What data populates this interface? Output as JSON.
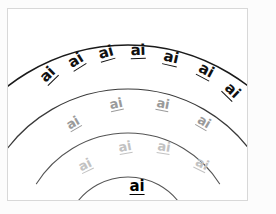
{
  "card": {
    "background": "#ffffff",
    "border_color": "#d8d8d8",
    "page_background": "#fcfcfc"
  },
  "worksheet": {
    "title": "ai rainbow words",
    "grapheme": "ai",
    "description": "Four concentric rainbow arcs with the word 'ai' repeated along each arc, fading from black to light gray."
  },
  "arcs": [
    {
      "name": "arc-1-outer",
      "stroke": "#1a1a1a",
      "stroke_width": 1.5,
      "cx": 120,
      "cy": 232,
      "r": 196,
      "start_angle": -152,
      "end_angle": -28
    },
    {
      "name": "arc-2",
      "stroke": "#3a3a3a",
      "stroke_width": 1.2,
      "cx": 120,
      "cy": 232,
      "r": 152,
      "start_angle": -150,
      "end_angle": -30
    },
    {
      "name": "arc-3",
      "stroke": "#555555",
      "stroke_width": 1.1,
      "cx": 120,
      "cy": 232,
      "r": 108,
      "start_angle": -148,
      "end_angle": -32
    },
    {
      "name": "arc-4-inner",
      "stroke": "#555555",
      "stroke_width": 1.1,
      "cx": 120,
      "cy": 232,
      "r": 64,
      "start_angle": -144,
      "end_angle": -36
    }
  ],
  "rows": [
    {
      "name": "row-1",
      "color": "#111111",
      "font_size": 15,
      "font_weight": 700,
      "underline_width": 1.6,
      "words": [
        {
          "text": "ai",
          "x": 40,
          "y": 66,
          "rotate": -44
        },
        {
          "text": "ai",
          "x": 68,
          "y": 52,
          "rotate": -32
        },
        {
          "text": "ai",
          "x": 98,
          "y": 44,
          "rotate": -16
        },
        {
          "text": "ai",
          "x": 130,
          "y": 42,
          "rotate": -2
        },
        {
          "text": "ai",
          "x": 163,
          "y": 49,
          "rotate": 13
        },
        {
          "text": "ai",
          "x": 198,
          "y": 62,
          "rotate": 28
        },
        {
          "text": "ai",
          "x": 224,
          "y": 82,
          "rotate": 44
        }
      ]
    },
    {
      "name": "row-2",
      "color": "#9a9a9a",
      "font_size": 13,
      "font_weight": 600,
      "underline_width": 1.2,
      "words": [
        {
          "text": "ai",
          "x": 65,
          "y": 114,
          "rotate": -30
        },
        {
          "text": "ai",
          "x": 108,
          "y": 95,
          "rotate": -12
        },
        {
          "text": "ai",
          "x": 155,
          "y": 95,
          "rotate": 11
        },
        {
          "text": "ai",
          "x": 196,
          "y": 113,
          "rotate": 30
        }
      ]
    },
    {
      "name": "row-3",
      "color": "#c2c2c2",
      "font_size": 13,
      "font_weight": 600,
      "underline_width": 1.2,
      "words": [
        {
          "text": "ai",
          "x": 77,
          "y": 156,
          "rotate": -26
        },
        {
          "text": "ai",
          "x": 117,
          "y": 138,
          "rotate": -10
        },
        {
          "text": "ai",
          "x": 156,
          "y": 138,
          "rotate": 9
        },
        {
          "text": "ai",
          "x": 194,
          "y": 155,
          "rotate": 26
        }
      ]
    },
    {
      "name": "row-4",
      "color": "#000000",
      "font_size": 15,
      "font_weight": 700,
      "underline_width": 1.8,
      "words": [
        {
          "text": "ai",
          "x": 129,
          "y": 178,
          "rotate": 0
        }
      ]
    }
  ]
}
